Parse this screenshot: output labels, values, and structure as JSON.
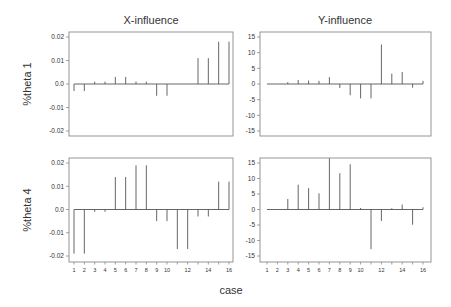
{
  "figure": {
    "xlabel": "case",
    "column_titles": [
      "X-influence",
      "Y-influence"
    ],
    "row_labels": [
      "%theta 1",
      "%theta 4"
    ],
    "colors": {
      "spike": "#555555",
      "frame": "#8a8a8a",
      "text": "#333333",
      "background": "#ffffff"
    }
  },
  "chart_data": [
    {
      "type": "bar",
      "style": "spike",
      "title": "X-influence",
      "ylabel": "%theta 1",
      "xlabel": "case",
      "x": [
        1,
        2,
        3,
        4,
        5,
        6,
        7,
        8,
        9,
        10,
        11,
        12,
        13,
        14,
        15,
        16
      ],
      "values": [
        -0.003,
        -0.003,
        0.001,
        0.001,
        0.003,
        0.003,
        0.001,
        0.001,
        -0.005,
        -0.005,
        0.0,
        0.0,
        0.011,
        0.011,
        0.018,
        0.018
      ],
      "ylim": [
        -0.02,
        0.02
      ],
      "yticks": [
        0.02,
        0.01,
        0.0,
        -0.01,
        -0.02
      ],
      "ytick_labels": [
        "0.02",
        "0.01",
        "0.0",
        "-0.01",
        "-0.02"
      ],
      "xticks_shown": false,
      "grid": false
    },
    {
      "type": "bar",
      "style": "spike",
      "title": "Y-influence",
      "ylabel": "%theta 1",
      "xlabel": "case",
      "x": [
        1,
        2,
        3,
        4,
        5,
        6,
        7,
        8,
        9,
        10,
        11,
        12,
        13,
        14,
        15,
        16
      ],
      "values": [
        0,
        0,
        0.6,
        1.3,
        1.1,
        1.0,
        2.2,
        -1.3,
        -3.6,
        -4.6,
        -4.6,
        12.6,
        3.3,
        3.8,
        -1.2,
        1.0
      ],
      "ylim": [
        -15,
        15
      ],
      "yticks": [
        15,
        10,
        5,
        0,
        -5,
        -10,
        -15
      ],
      "ytick_labels": [
        "15",
        "10",
        "5",
        "0",
        "-5",
        "-10",
        "-15"
      ],
      "xticks_shown": false,
      "grid": false
    },
    {
      "type": "bar",
      "style": "spike",
      "title": "X-influence",
      "ylabel": "%theta 4",
      "xlabel": "case",
      "x": [
        1,
        2,
        3,
        4,
        5,
        6,
        7,
        8,
        9,
        10,
        11,
        12,
        13,
        14,
        15,
        16
      ],
      "values": [
        -0.019,
        -0.019,
        -0.001,
        -0.001,
        0.014,
        0.014,
        0.019,
        0.019,
        -0.005,
        -0.005,
        -0.017,
        -0.017,
        -0.003,
        -0.003,
        0.012,
        0.012
      ],
      "ylim": [
        -0.02,
        0.02
      ],
      "yticks": [
        0.02,
        0.01,
        0.0,
        -0.01,
        -0.02
      ],
      "ytick_labels": [
        "0.02",
        "0.01",
        "0.0",
        "-0.01",
        "-0.02"
      ],
      "xticks_shown": true,
      "xtick_labels": [
        "1",
        "2",
        "3",
        "4",
        "5",
        "6",
        "7",
        "8",
        "9",
        "10",
        "12",
        "14",
        "16"
      ],
      "xtick_positions": [
        1,
        2,
        3,
        4,
        5,
        6,
        7,
        8,
        9,
        10,
        12,
        14,
        16
      ],
      "grid": false
    },
    {
      "type": "bar",
      "style": "spike",
      "title": "Y-influence",
      "ylabel": "%theta 4",
      "xlabel": "case",
      "x": [
        1,
        2,
        3,
        4,
        5,
        6,
        7,
        8,
        9,
        10,
        11,
        12,
        13,
        14,
        15,
        16
      ],
      "values": [
        0,
        0,
        3.4,
        8.0,
        6.9,
        5.2,
        16.5,
        11.7,
        14.6,
        0.5,
        -12.8,
        -3.7,
        0.4,
        1.6,
        -4.9,
        0.7
      ],
      "ylim": [
        -15,
        15
      ],
      "yticks": [
        15,
        10,
        5,
        0,
        -5,
        -10,
        -15
      ],
      "ytick_labels": [
        "15",
        "10",
        "5",
        "0",
        "-5",
        "-10",
        "-15"
      ],
      "xticks_shown": true,
      "xtick_labels": [
        "1",
        "2",
        "3",
        "4",
        "5",
        "6",
        "7",
        "8",
        "9",
        "10",
        "12",
        "14",
        "16"
      ],
      "xtick_positions": [
        1,
        2,
        3,
        4,
        5,
        6,
        7,
        8,
        9,
        10,
        12,
        14,
        16
      ],
      "grid": false
    }
  ]
}
